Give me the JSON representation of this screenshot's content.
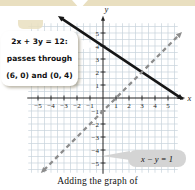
{
  "figure": {
    "caption": "Adding the graph of",
    "callout": {
      "line1": "2x + 3y = 12:",
      "line2": "passes through",
      "line3": "(6, 0) and (0, 4)"
    },
    "equation_label": "x − y = 1",
    "colors": {
      "band_tan": "#e9dfc0",
      "grid": "#c7d2db",
      "axis": "#222222",
      "solid_line": "#161616",
      "dashed_line": "#8d8d8d",
      "label_box": "#d4d4d4"
    }
  },
  "chart_data": {
    "type": "line",
    "title": "",
    "xlabel": "x",
    "ylabel": "y",
    "xlim": [
      -5.75,
      5.75
    ],
    "ylim": [
      -5.75,
      5.75
    ],
    "x_ticks": [
      -5,
      -4,
      -3,
      -2,
      -1,
      1,
      2,
      3,
      4,
      5
    ],
    "y_ticks": [
      -5,
      -4,
      -3,
      -2,
      -1,
      1,
      2,
      3,
      4,
      5
    ],
    "grid_spacing": 0.5,
    "legend": "none",
    "series": [
      {
        "name": "2x + 3y = 12",
        "style": "solid",
        "color": "#161616",
        "points": [
          [
            -3.2,
            6.13
          ],
          [
            5.92,
            0.05
          ]
        ],
        "noted_points": [
          [
            6,
            0
          ],
          [
            0,
            4
          ]
        ]
      },
      {
        "name": "x − y = 1",
        "style": "dashed",
        "color": "#8d8d8d",
        "points": [
          [
            -4.55,
            -5.55
          ],
          [
            5.85,
            4.85
          ]
        ]
      }
    ]
  }
}
